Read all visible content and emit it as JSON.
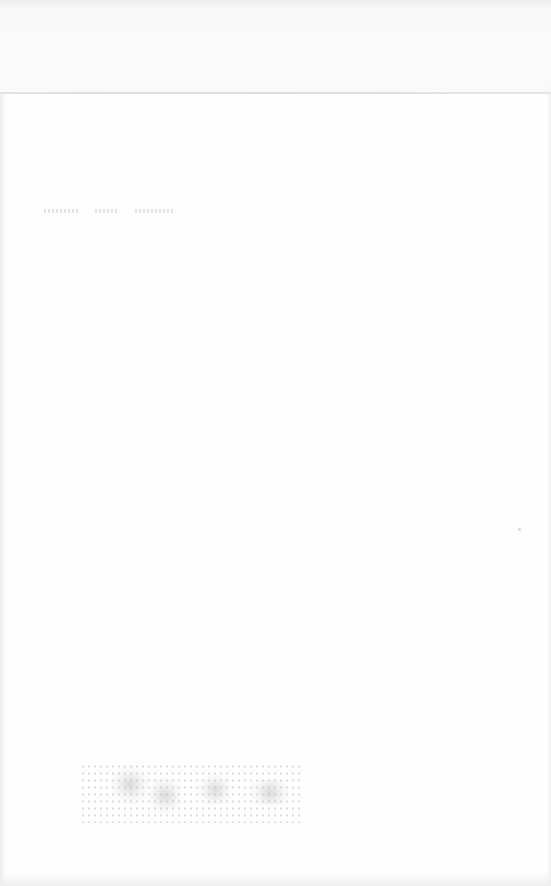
{
  "document": {
    "type": "scanned-page",
    "header": {
      "text": ""
    },
    "body": {
      "lines": [
        ""
      ]
    },
    "stamp": {
      "present": true,
      "text": ""
    },
    "colors": {
      "paper": "#fefefe",
      "header_band": "#f8f8f8",
      "rule": "#dcdcdc",
      "ink_faint": "#c8c8c8"
    }
  }
}
